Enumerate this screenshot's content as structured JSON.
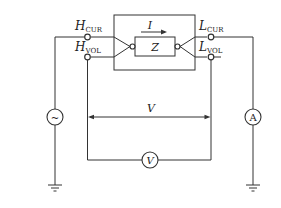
{
  "diagram": {
    "type": "four-terminal impedance measurement circuit",
    "terminals": {
      "h_cur": {
        "main": "H",
        "sub": "CUR"
      },
      "h_vol": {
        "main": "H",
        "sub": "VOL"
      },
      "l_cur": {
        "main": "L",
        "sub": "CUR"
      },
      "l_vol": {
        "main": "L",
        "sub": "VOL"
      }
    },
    "dut": {
      "current_label": "I",
      "impedance_label": "Z"
    },
    "source": {
      "symbol": "~"
    },
    "ammeter": {
      "symbol": "A"
    },
    "voltmeter": {
      "symbol": "V"
    },
    "voltage_label": "V",
    "colors": {
      "line": "#333333",
      "background": "#ffffff"
    }
  }
}
